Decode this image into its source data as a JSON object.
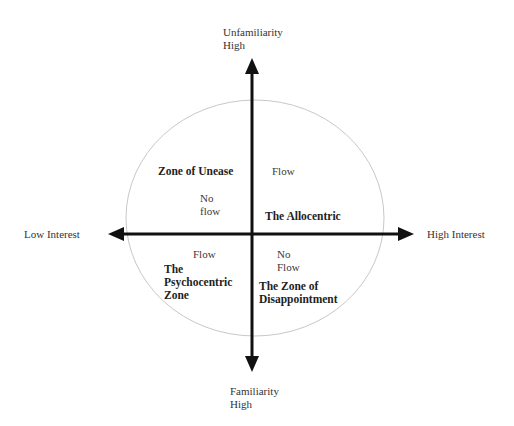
{
  "diagram": {
    "axes": {
      "top": {
        "line1": "Unfamiliarity",
        "line2": "High"
      },
      "bottom": {
        "line1": "Familiarity",
        "line2": "High"
      },
      "left": {
        "label": "Low Interest"
      },
      "right": {
        "label": "High Interest"
      }
    },
    "zones": {
      "unease": {
        "label": "Zone of Unease"
      },
      "allocentric": {
        "label": "The Allocentric"
      },
      "psychocentric": {
        "line1": "The",
        "line2": "Psychocentric",
        "line3": "Zone"
      },
      "disappointment": {
        "line1": "The Zone of",
        "line2": "Disappointment"
      }
    },
    "flow_labels": {
      "upper_left": {
        "line1": "No",
        "line2": "flow"
      },
      "upper_right": {
        "label": "Flow"
      },
      "lower_left": {
        "label": "Flow"
      },
      "lower_right": {
        "line1": "No",
        "line2": "Flow"
      }
    },
    "colors": {
      "axis": "#111111",
      "circle": "#c8c8c8",
      "text": "#333333"
    }
  }
}
